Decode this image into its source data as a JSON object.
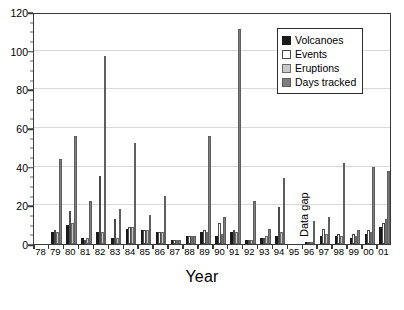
{
  "chart_data": {
    "type": "bar",
    "title": "",
    "xlabel": "Year",
    "ylabel": "",
    "ylim": [
      0,
      120
    ],
    "ytick_step": 20,
    "yticks": [
      0,
      20,
      40,
      60,
      80,
      100,
      120
    ],
    "grid": "horizontal",
    "legend_position": "top-right",
    "categories": [
      "78",
      "79",
      "80",
      "81",
      "82",
      "83",
      "84",
      "85",
      "86",
      "87",
      "88",
      "89",
      "90",
      "91",
      "92",
      "93",
      "94",
      "95",
      "96",
      "97",
      "98",
      "99",
      "00",
      "01"
    ],
    "series": [
      {
        "name": "Volcanoes",
        "color": "#1a1a1a",
        "values": [
          0,
          6,
          10,
          3,
          6,
          3,
          8,
          7,
          6,
          2,
          4,
          6,
          4,
          6,
          2,
          3,
          4,
          0,
          1,
          4,
          4,
          3,
          5,
          9
        ]
      },
      {
        "name": "Events",
        "color": "#ffffff",
        "values": [
          0,
          7,
          17,
          2,
          35,
          13,
          9,
          7,
          6,
          2,
          4,
          7,
          11,
          7,
          2,
          3,
          19,
          0,
          1,
          8,
          5,
          5,
          7,
          11
        ]
      },
      {
        "name": "Eruptions",
        "color": "#c8c8c8",
        "values": [
          0,
          6,
          11,
          3,
          6,
          3,
          9,
          7,
          6,
          2,
          4,
          6,
          5,
          6,
          2,
          4,
          6,
          0,
          1,
          5,
          4,
          4,
          6,
          13
        ]
      },
      {
        "name": "Days tracked",
        "color": "#7d7d7d",
        "values": [
          0,
          44,
          56,
          22,
          97,
          18,
          52,
          15,
          25,
          2,
          4,
          56,
          14,
          111,
          22,
          8,
          34,
          0,
          12,
          14,
          42,
          7,
          40,
          38
        ]
      }
    ],
    "annotations": [
      {
        "text": "Data gap",
        "category": "95",
        "orientation": "vertical"
      }
    ]
  },
  "legend": {
    "items": [
      {
        "label": "Volcanoes",
        "swatch": "volcanoes"
      },
      {
        "label": "Events",
        "swatch": "events"
      },
      {
        "label": "Eruptions",
        "swatch": "eruptions"
      },
      {
        "label": "Days tracked",
        "swatch": "days"
      }
    ]
  }
}
